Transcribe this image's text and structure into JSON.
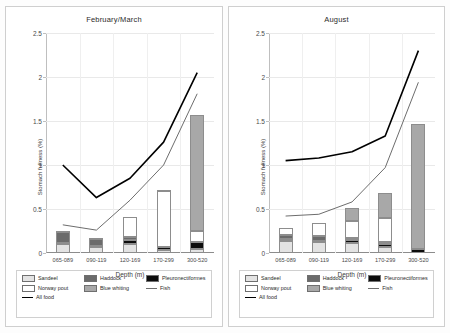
{
  "figure": {
    "y_axis_title": "Stomach fullness (%)",
    "x_axis_title": "Depth (m)",
    "y_ticks": [
      "0",
      "0.5",
      "1",
      "1.5",
      "2",
      "2.5"
    ],
    "categories": [
      "065-089",
      "090-119",
      "120-169",
      "170-299",
      "300-520"
    ]
  },
  "legend": {
    "items": [
      {
        "label": "Sandeel",
        "swatch": "bar",
        "color": "#e3e3e3"
      },
      {
        "label": "Haddock",
        "swatch": "bar",
        "color": "#6b6b6b"
      },
      {
        "label": "Pleuronectiformes",
        "swatch": "bar",
        "color": "#0d0d0d"
      },
      {
        "label": "Norway pout",
        "swatch": "bar",
        "color": "#ffffff"
      },
      {
        "label": "Blue whiting",
        "swatch": "bar",
        "color": "#a8a8a8"
      },
      {
        "label": "Fish",
        "swatch": "line",
        "color": "#6d6d6d"
      },
      {
        "label": "All food",
        "swatch": "line",
        "color": "#000000"
      }
    ]
  },
  "chart_data": [
    {
      "type": "bar",
      "title": "February/March",
      "xlabel": "Depth (m)",
      "ylabel": "Stomach fullness (%)",
      "ylim": [
        0,
        2.5
      ],
      "grid": true,
      "legend_position": "bottom",
      "stacked": true,
      "categories": [
        "065-089",
        "090-119",
        "120-169",
        "170-299",
        "300-520"
      ],
      "series": [
        {
          "name": "Sandeel",
          "values": [
            0.1,
            0.07,
            0.1,
            0.03,
            0.05
          ]
        },
        {
          "name": "Pleuronectiformes",
          "values": [
            0.01,
            0.01,
            0.05,
            0.04,
            0.07
          ]
        },
        {
          "name": "Haddock",
          "values": [
            0.13,
            0.08,
            0.03,
            0.0,
            0.0
          ]
        },
        {
          "name": "Norway pout",
          "values": [
            0.01,
            0.01,
            0.23,
            0.63,
            0.13
          ]
        },
        {
          "name": "Blue whiting",
          "values": [
            0.0,
            0.0,
            0.0,
            0.02,
            1.32
          ]
        }
      ],
      "bar_totals": [
        0.25,
        0.17,
        0.41,
        0.72,
        1.57
      ],
      "lines": [
        {
          "name": "Fish",
          "values": [
            0.32,
            0.26,
            0.6,
            1.0,
            1.81
          ]
        },
        {
          "name": "All food",
          "values": [
            1.0,
            0.63,
            0.85,
            1.26,
            2.05
          ]
        }
      ]
    },
    {
      "type": "bar",
      "title": "August",
      "xlabel": "Depth (m)",
      "ylabel": "Stomach fullness (%)",
      "ylim": [
        0,
        2.5
      ],
      "grid": true,
      "legend_position": "bottom",
      "stacked": true,
      "categories": [
        "065-089",
        "090-119",
        "120-169",
        "170-299",
        "300-520"
      ],
      "series": [
        {
          "name": "Sandeel",
          "values": [
            0.14,
            0.12,
            0.11,
            0.07,
            0.0
          ]
        },
        {
          "name": "Pleuronectiformes",
          "values": [
            0.02,
            0.02,
            0.04,
            0.03,
            0.05
          ]
        },
        {
          "name": "Haddock",
          "values": [
            0.05,
            0.05,
            0.02,
            0.02,
            0.0
          ]
        },
        {
          "name": "Norway pout",
          "values": [
            0.07,
            0.15,
            0.19,
            0.28,
            0.0
          ]
        },
        {
          "name": "Blue whiting",
          "values": [
            0.0,
            0.0,
            0.15,
            0.28,
            1.42
          ]
        }
      ],
      "bar_totals": [
        0.28,
        0.34,
        0.51,
        0.68,
        1.47
      ],
      "lines": [
        {
          "name": "Fish",
          "values": [
            0.42,
            0.44,
            0.58,
            0.97,
            1.94
          ]
        },
        {
          "name": "All food",
          "values": [
            1.05,
            1.08,
            1.15,
            1.33,
            2.3
          ]
        }
      ]
    }
  ]
}
